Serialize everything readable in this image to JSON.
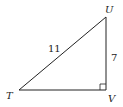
{
  "diagram": {
    "type": "right-triangle",
    "vertices": [
      {
        "name": "T",
        "label": "T"
      },
      {
        "name": "U",
        "label": "U"
      },
      {
        "name": "V",
        "label": "V"
      }
    ],
    "right_angle_at": "V",
    "sides": [
      {
        "between": "T-U",
        "label": "11"
      },
      {
        "between": "U-V",
        "label": "7"
      }
    ],
    "stroke_color": "#222222"
  }
}
